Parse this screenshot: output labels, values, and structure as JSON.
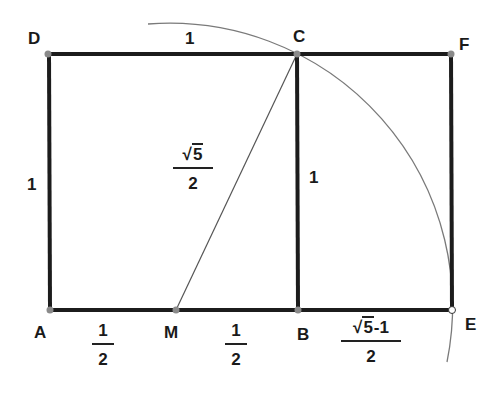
{
  "diagram": {
    "points": {
      "A": {
        "label": "A",
        "x": 50,
        "y": 310
      },
      "M": {
        "label": "M",
        "x": 176,
        "y": 310
      },
      "B": {
        "label": "B",
        "x": 298,
        "y": 310
      },
      "E": {
        "label": "E",
        "x": 452,
        "y": 310
      },
      "D": {
        "label": "D",
        "x": 48,
        "y": 54
      },
      "C": {
        "label": "C",
        "x": 297,
        "y": 54
      },
      "F": {
        "label": "F",
        "x": 451,
        "y": 54
      }
    },
    "edge_labels": {
      "DC": "1",
      "AD": "1",
      "BC": "1",
      "AM": {
        "num": "1",
        "den": "2"
      },
      "MB": {
        "num": "1",
        "den": "2"
      },
      "MC": {
        "sqrt": "5",
        "den": "2"
      },
      "BE": {
        "sqrt": "5",
        "suffix": "-1",
        "den": "2"
      }
    },
    "colors": {
      "thick_line": "#1c1c1c",
      "thin_line": "#555555",
      "arc": "#7a7a7a",
      "point_fill": "#8a8a8a",
      "open_point_fill": "#ffffff"
    }
  }
}
